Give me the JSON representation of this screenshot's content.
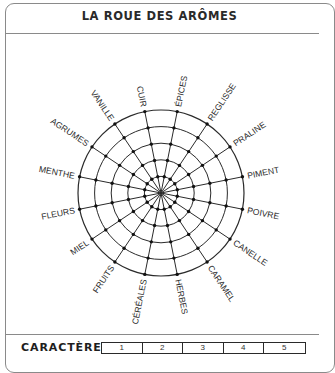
{
  "header": {
    "title": "LA ROUE DES ARÔMES"
  },
  "wheel": {
    "center": [
      161,
      193
    ],
    "outer_radius": 83,
    "rings": 5,
    "line_color": "#2a2a2a",
    "labels": [
      "ÉPICES",
      "REGLISSE",
      "PRALINE",
      "PIMENT",
      "POIVRE",
      "CANELLE",
      "CARAMEL",
      "HERBES",
      "CÉRÉALES",
      "FRUITS",
      "MIEL",
      "FLEURS",
      "MENTHE",
      "AGRUMES",
      "VANILLE",
      "CUIR"
    ]
  },
  "footer": {
    "label": "CARACTÈRE",
    "rating_options": [
      "1",
      "2",
      "3",
      "4",
      "5"
    ]
  }
}
